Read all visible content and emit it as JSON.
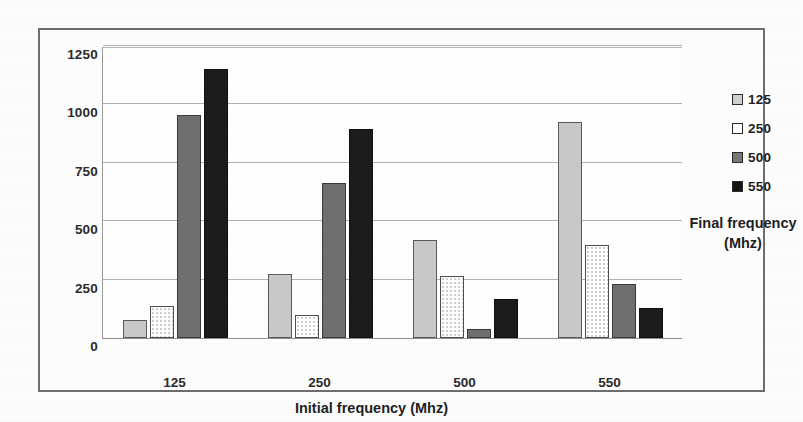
{
  "chart_data": {
    "type": "bar",
    "title": "Esc(μJ)",
    "title_base": "E",
    "title_sub": "sc",
    "title_tail": "(μJ)",
    "xlabel": "Initial frequency (Mhz)",
    "ylabel": "",
    "categories": [
      "125",
      "250",
      "500",
      "550"
    ],
    "ylim": [
      0,
      1250
    ],
    "yticks": [
      0,
      250,
      500,
      750,
      1000,
      1250
    ],
    "ytick_labels": [
      "0",
      "250",
      "500",
      "750",
      "1000",
      "1250"
    ],
    "grid": true,
    "legend_position": "right",
    "legend_title": "Final frequency",
    "legend_title_line2": "(Mhz)",
    "series": [
      {
        "name": "125",
        "color": "#c9c9c9",
        "values": [
          75,
          275,
          420,
          925
        ]
      },
      {
        "name": "250",
        "color": "#ffffff",
        "values": [
          135,
          100,
          265,
          400
        ]
      },
      {
        "name": "500",
        "color": "#6f6f6f",
        "values": [
          955,
          665,
          40,
          230
        ]
      },
      {
        "name": "550",
        "color": "#1c1c1c",
        "values": [
          1150,
          895,
          165,
          130
        ]
      }
    ]
  },
  "legend": {
    "title": "Final frequency",
    "title_line2": "(Mhz)",
    "items": [
      {
        "label": "125",
        "swatch": "legend-swatch-125"
      },
      {
        "label": "250",
        "swatch": "legend-swatch-250"
      },
      {
        "label": "500",
        "swatch": "legend-swatch-500"
      },
      {
        "label": "550",
        "swatch": "legend-swatch-550"
      }
    ]
  }
}
